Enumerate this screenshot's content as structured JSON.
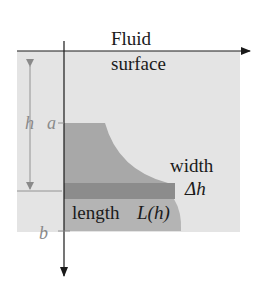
{
  "labels": {
    "fluid": "Fluid",
    "surface": "surface",
    "h": "h",
    "a": "a",
    "b": "b",
    "width": "width",
    "delta_h": "Δh",
    "length": "length",
    "L_of_h": "L(h)"
  },
  "colors": {
    "fluid": "#e4e4e4",
    "plate": "#a8a8a8",
    "strip": "#8c8c8c",
    "axis": "#1a1a1a",
    "guide": "#8a8a8a",
    "label_gray": "#8a8a8a",
    "text": "#1a1a1a"
  }
}
